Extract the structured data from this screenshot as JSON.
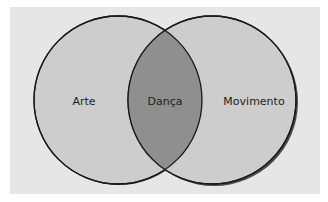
{
  "diagram": {
    "type": "venn",
    "sets": [
      {
        "id": "left",
        "label": "Arte"
      },
      {
        "id": "right",
        "label": "Movimento"
      }
    ],
    "intersection": {
      "label": "Dança"
    }
  },
  "colors": {
    "background": "#ffffff",
    "panel": "#e6e6e6",
    "circle_fill": "#cdcdcd",
    "intersection_fill": "#8f8f8f",
    "stroke": "#1a1a1a",
    "shadow": "#4a4a4a"
  }
}
